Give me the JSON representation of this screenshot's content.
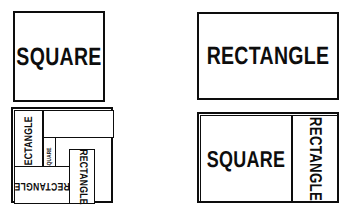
{
  "figure": {
    "stroke_color": "#0d0d0d",
    "fill_color": "#ffffff",
    "background": "#ffffff"
  },
  "panels": {
    "top_left": {
      "name": "plain-square",
      "label": "SQUARE",
      "orientation": "horizontal"
    },
    "top_right": {
      "name": "plain-rectangle",
      "label": "RECTANGLE",
      "orientation": "horizontal"
    },
    "bottom_left": {
      "name": "subdivided-composite",
      "cells": [
        {
          "label": "RECTANGLE",
          "orientation": "rotated-90-ccw"
        },
        {
          "label": "SQUARE",
          "orientation": "rotated-90-ccw"
        },
        {
          "label": "RECTANGLE",
          "orientation": "rotated-180"
        },
        {
          "label": "RECTANGLE",
          "orientation": "rotated-90-cw"
        },
        {
          "label": "",
          "orientation": "blank"
        }
      ]
    },
    "bottom_right": {
      "name": "square-plus-rectangle",
      "cells": [
        {
          "label": "SQUARE",
          "orientation": "horizontal"
        },
        {
          "label": "RECTANGLE",
          "orientation": "rotated-90-cw"
        }
      ]
    }
  }
}
